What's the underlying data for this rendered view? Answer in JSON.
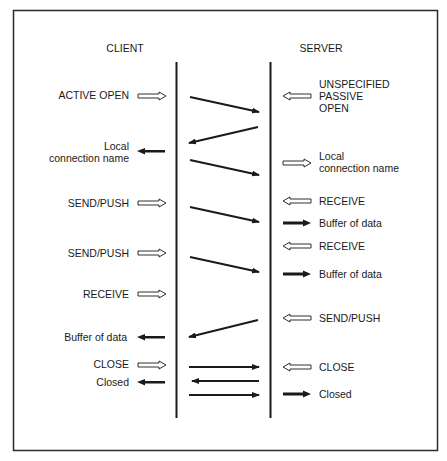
{
  "diagram": {
    "headers": {
      "client": "CLIENT",
      "server": "SERVER"
    },
    "client_events": [
      {
        "id": "active-open",
        "lines": [
          "ACTIVE OPEN"
        ],
        "arrow": "hollow-in"
      },
      {
        "id": "local-connection-name",
        "lines": [
          "Local",
          "connection name"
        ],
        "arrow": "filled-out"
      },
      {
        "id": "send-push-1",
        "lines": [
          "SEND/PUSH"
        ],
        "arrow": "hollow-in"
      },
      {
        "id": "send-push-2",
        "lines": [
          "SEND/PUSH"
        ],
        "arrow": "hollow-in"
      },
      {
        "id": "receive",
        "lines": [
          "RECEIVE"
        ],
        "arrow": "hollow-in"
      },
      {
        "id": "buffer-of-data",
        "lines": [
          "Buffer of data"
        ],
        "arrow": "filled-out"
      },
      {
        "id": "close",
        "lines": [
          "CLOSE"
        ],
        "arrow": "hollow-in"
      },
      {
        "id": "closed",
        "lines": [
          "Closed"
        ],
        "arrow": "filled-out"
      }
    ],
    "server_events": [
      {
        "id": "unspecified-passive-open",
        "lines": [
          "UNSPECIFIED",
          "PASSIVE",
          "OPEN"
        ],
        "arrow": "hollow-in"
      },
      {
        "id": "local-connection-name",
        "lines": [
          "Local",
          "connection name"
        ],
        "arrow": "hollow-out"
      },
      {
        "id": "receive-1",
        "lines": [
          "RECEIVE"
        ],
        "arrow": "hollow-in"
      },
      {
        "id": "buffer-of-data-1",
        "lines": [
          "Buffer of data"
        ],
        "arrow": "filled-out"
      },
      {
        "id": "receive-2",
        "lines": [
          "RECEIVE"
        ],
        "arrow": "hollow-in"
      },
      {
        "id": "buffer-of-data-2",
        "lines": [
          "Buffer of data"
        ],
        "arrow": "filled-out"
      },
      {
        "id": "send-push",
        "lines": [
          "SEND/PUSH"
        ],
        "arrow": "hollow-in"
      },
      {
        "id": "close",
        "lines": [
          "CLOSE"
        ],
        "arrow": "hollow-in"
      },
      {
        "id": "closed",
        "lines": [
          "Closed"
        ],
        "arrow": "filled-out"
      }
    ],
    "messages": [
      {
        "from": "client",
        "to": "server"
      },
      {
        "from": "server",
        "to": "client"
      },
      {
        "from": "client",
        "to": "server"
      },
      {
        "from": "client",
        "to": "server"
      },
      {
        "from": "client",
        "to": "server"
      },
      {
        "from": "server",
        "to": "client"
      },
      {
        "from": "client",
        "to": "server"
      },
      {
        "from": "server",
        "to": "client"
      },
      {
        "from": "client",
        "to": "server"
      }
    ],
    "colors": {
      "ink": "#1a1a1a",
      "frame": "#2a2a2a",
      "background": "#ffffff"
    }
  }
}
